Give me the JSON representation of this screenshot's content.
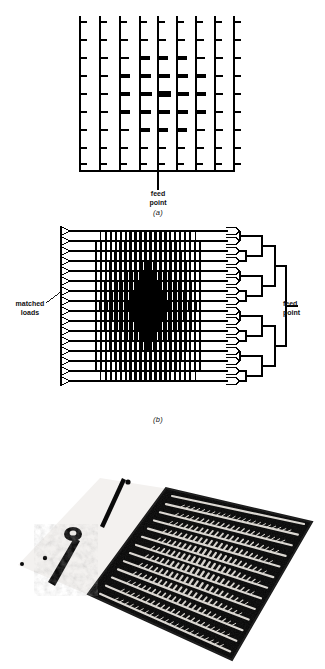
{
  "document": {
    "type": "technical-figure",
    "subject": "microstrip comb-line antenna arrays",
    "background_color": "#ffffff",
    "ink_color": "#000000",
    "width_px": 325,
    "height_px": 669
  },
  "figure_a": {
    "caption": "(a)",
    "description": "series-fed comb-line microstrip array, 9 vertical feed lines with tapered radiating stubs, fed from a horizontal bus at the bottom centre",
    "feed_label": {
      "line1": "feed",
      "line2": "point"
    },
    "columns": 9,
    "rows": 9,
    "frame": {
      "x": 77,
      "y": 16,
      "width": 160,
      "height": 155
    },
    "column_x": [
      80,
      100,
      120,
      140,
      158,
      177,
      196,
      215,
      234
    ],
    "row_y": [
      22,
      40,
      58,
      76,
      94,
      112,
      130,
      148,
      164
    ],
    "stub_weights": [
      [
        1,
        1,
        1,
        1,
        1,
        1,
        1,
        1,
        1
      ],
      [
        1,
        1,
        2,
        2,
        2,
        2,
        2,
        1,
        1
      ],
      [
        1,
        2,
        3,
        4,
        4,
        4,
        3,
        2,
        1
      ],
      [
        1,
        2,
        4,
        5,
        6,
        5,
        4,
        2,
        1
      ],
      [
        1,
        2,
        4,
        6,
        7,
        6,
        4,
        2,
        1
      ],
      [
        1,
        2,
        4,
        5,
        6,
        5,
        4,
        2,
        1
      ],
      [
        1,
        2,
        3,
        4,
        4,
        4,
        3,
        2,
        1
      ],
      [
        1,
        1,
        2,
        2,
        2,
        2,
        2,
        1,
        1
      ],
      [
        1,
        1,
        1,
        1,
        1,
        1,
        1,
        1,
        1
      ]
    ],
    "bus_y": 171,
    "feed_stem": {
      "x": 158,
      "y_top": 171,
      "y_bottom": 190
    }
  },
  "figure_b": {
    "caption": "(b)",
    "description": "corporate-fed travelling-wave microstrip array; each of 16 horizontal lines is terminated at the left in a triangular matched load and combined on the right by a binary feed network",
    "matched_loads_label": {
      "line1": "matched",
      "line2": "loads"
    },
    "feed_point_label": {
      "line1": "feed",
      "line2": "point"
    },
    "rows": 16,
    "row_y": [
      231,
      241,
      251,
      261,
      271,
      281,
      291,
      301,
      311,
      321,
      331,
      341,
      351,
      361,
      371,
      381
    ],
    "line_x_start": 70,
    "line_x_end": 228,
    "array_x_start": 96,
    "array_x_end": 200,
    "load_triangle": {
      "width": 9,
      "height": 9,
      "x": 61
    },
    "feed_network": {
      "type": "binary-corporate-tree",
      "stages": 4,
      "trunk_x": 286,
      "feed_point_y": 306
    }
  },
  "figure_c": {
    "caption": "",
    "description": "photograph of the fabricated microstrip comb-line array panel on its ground plane, with coaxial connector and feed probe at the left",
    "frame": {
      "x": 12,
      "y": 432,
      "width": 310,
      "height": 237
    },
    "panel_fill": "#050505",
    "substrate_fill": "#f2f0ee",
    "trace_fill": "#e8e6e2",
    "element_rows": 14,
    "connector": {
      "x": 60,
      "y": 490,
      "label": "coaxial-connector"
    }
  }
}
